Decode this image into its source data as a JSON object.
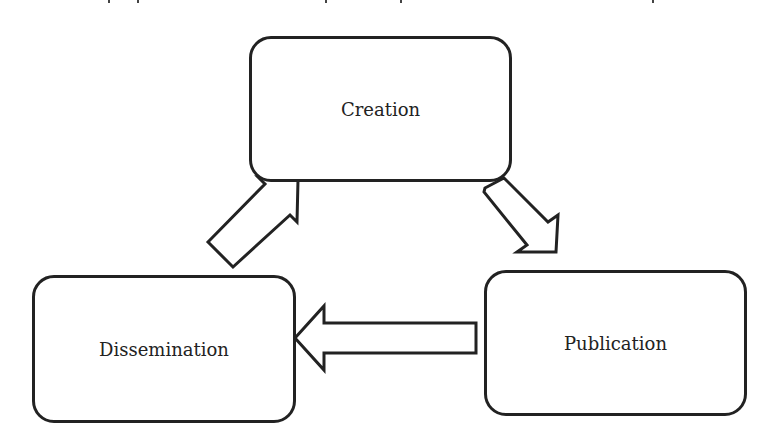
{
  "diagram": {
    "type": "cycle",
    "nodes": [
      {
        "id": "creation",
        "label": "Creation"
      },
      {
        "id": "publication",
        "label": "Publication"
      },
      {
        "id": "dissemination",
        "label": "Dissemination"
      }
    ],
    "edges": [
      {
        "from": "creation",
        "to": "publication",
        "style": "hollow-block-arrow"
      },
      {
        "from": "publication",
        "to": "dissemination",
        "style": "hollow-block-arrow"
      },
      {
        "from": "dissemination",
        "to": "creation",
        "style": "hollow-block-arrow"
      }
    ],
    "colors": {
      "stroke": "#222222",
      "fill": "#ffffff",
      "background": "#ffffff"
    }
  }
}
